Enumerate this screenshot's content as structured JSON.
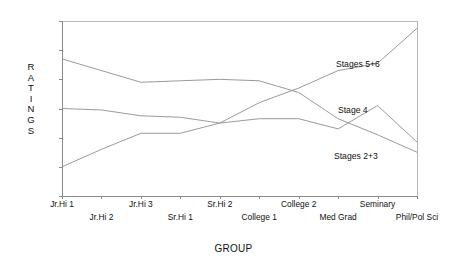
{
  "chart_data": {
    "type": "line",
    "title": "",
    "xlabel": "GROUP",
    "ylabel": "RATINGS",
    "ylim": [
      10,
      70
    ],
    "yticks": [
      10,
      20,
      30,
      40,
      50,
      60,
      70
    ],
    "grid": false,
    "legend_position": "inline-annotations",
    "categories": [
      "Jr.Hi 1",
      "Jr.Hi 2",
      "Jr.Hi 3",
      "Sr.Hi 1",
      "Sr.Hi 2",
      "College 1",
      "College 2",
      "Med Grad",
      "Seminary",
      "Phil/Pol Sci"
    ],
    "series": [
      {
        "name": "Stages 2+3",
        "values": [
          57,
          53,
          49,
          49.5,
          50,
          49.5,
          45.5,
          36.5,
          31,
          25
        ]
      },
      {
        "name": "Stage 4",
        "values": [
          40,
          39.5,
          37.5,
          37,
          35,
          36.5,
          36.5,
          33,
          41,
          28.5
        ]
      },
      {
        "name": "Stages 5+6",
        "values": [
          20,
          26,
          31.5,
          31.5,
          35,
          42,
          47,
          53,
          55.5,
          67.5
        ]
      }
    ],
    "annotations": [
      {
        "text": "Stages 5+6",
        "anchor_category": "Seminary"
      },
      {
        "text": "Stage 4",
        "anchor_category": "Seminary"
      },
      {
        "text": "Stages 2+3",
        "anchor_category": "Seminary"
      }
    ]
  },
  "axis": {
    "y_title_letters": [
      "R",
      "A",
      "T",
      "I",
      "N",
      "G",
      "S"
    ],
    "x_title": "GROUP"
  }
}
